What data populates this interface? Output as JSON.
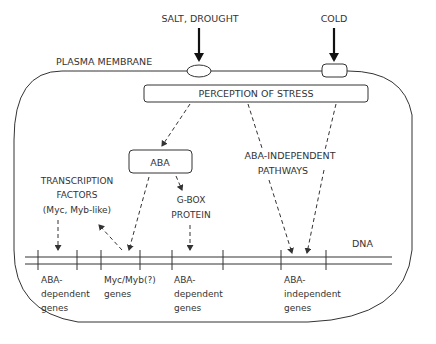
{
  "diagram": {
    "colors": {
      "line": "#333333",
      "background": "#ffffff",
      "stimulus_arrow": "#111111"
    },
    "stimuli": {
      "salt_drought": "SALT, DROUGHT",
      "cold": "COLD"
    },
    "membrane_label": "PLASMA MEMBRANE",
    "perception_box": "PERCEPTION OF STRESS",
    "aba_box": "ABA",
    "transcription_factors": {
      "line1": "TRANSCRIPTION",
      "line2": "FACTORS",
      "line3": "(Myc, Myb-like)"
    },
    "gbox_protein": {
      "line1": "G-BOX",
      "line2": "PROTEIN"
    },
    "aba_independent_pathways": {
      "line1": "ABA-INDEPENDENT",
      "line2": "PATHWAYS"
    },
    "dna_label": "DNA",
    "gene_groups": [
      {
        "line1": "ABA-",
        "line2": "dependent",
        "line3": "genes"
      },
      {
        "line1": "Myc/Myb(?)",
        "line2": "genes"
      },
      {
        "line1": "ABA-",
        "line2": "dependent",
        "line3": "genes"
      },
      {
        "line1": "ABA-",
        "line2": "independent",
        "line3": "genes"
      }
    ]
  }
}
